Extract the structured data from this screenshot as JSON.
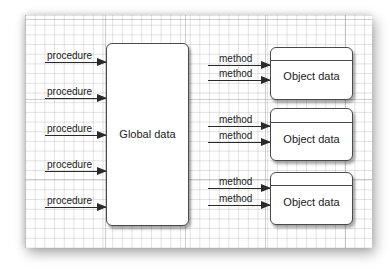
{
  "diagram": {
    "type": "procedural-vs-object-oriented",
    "global_box": {
      "label": "Global data"
    },
    "procedures": [
      {
        "label": "procedure"
      },
      {
        "label": "procedure"
      },
      {
        "label": "procedure"
      },
      {
        "label": "procedure"
      },
      {
        "label": "procedure"
      }
    ],
    "objects": [
      {
        "label": "Object data",
        "methods": [
          {
            "label": "method"
          },
          {
            "label": "method"
          }
        ]
      },
      {
        "label": "Object data",
        "methods": [
          {
            "label": "method"
          },
          {
            "label": "method"
          }
        ]
      },
      {
        "label": "Object data",
        "methods": [
          {
            "label": "method"
          },
          {
            "label": "method"
          }
        ]
      }
    ],
    "colors": {
      "stroke": "#2a2a2a",
      "grid": "#c8c8c8",
      "paper": "#ffffff"
    }
  }
}
